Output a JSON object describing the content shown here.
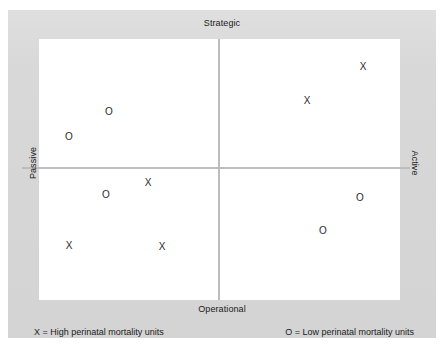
{
  "figure": {
    "type": "quadrant-matrix",
    "panel_color": "#d8d8d8",
    "plot_color": "#ffffff",
    "axis_color": "#bdbdbd"
  },
  "axes": {
    "top_label": "Strategic",
    "bottom_label": "Operational",
    "left_label": "Passive",
    "right_label": "Active"
  },
  "legend": {
    "high_label": "X = High perinatal mortality units",
    "low_label": "O = Low perinatal mortality units",
    "high_symbol": "X",
    "low_symbol": "O"
  },
  "chart_data": {
    "type": "scatter",
    "title": "",
    "subtitle": "",
    "xlabel": "Passive → Active",
    "ylabel": "Operational → Strategic",
    "xlim": [
      0,
      100
    ],
    "ylim": [
      0,
      100
    ],
    "grid": false,
    "legend_position": "bottom",
    "annotations": [
      "Strategic",
      "Operational",
      "Passive",
      "Active"
    ],
    "quadrants": [
      {
        "name": "passive-strategic",
        "x_range": [
          0,
          50
        ],
        "y_range": [
          50,
          100
        ]
      },
      {
        "name": "active-strategic",
        "x_range": [
          50,
          100
        ],
        "y_range": [
          50,
          100
        ]
      },
      {
        "name": "passive-operational",
        "x_range": [
          0,
          50
        ],
        "y_range": [
          0,
          50
        ]
      },
      {
        "name": "active-operational",
        "x_range": [
          50,
          100
        ],
        "y_range": [
          0,
          50
        ]
      }
    ],
    "axis_cross": {
      "x": 50,
      "y": 50
    },
    "series": [
      {
        "name": "High perinatal mortality units",
        "marker": "X",
        "values": [
          {
            "x": 89.8,
            "y": 89.7,
            "px": 363,
            "py": 67,
            "quadrant": "active-strategic"
          },
          {
            "x": 74.2,
            "y": 76.6,
            "px": 307,
            "py": 101,
            "quadrant": "active-strategic"
          },
          {
            "x": 30.2,
            "y": 44.8,
            "px": 148,
            "py": 183,
            "quadrant": "passive-operational"
          },
          {
            "x": 8.3,
            "y": 20.7,
            "px": 69,
            "py": 246,
            "quadrant": "passive-operational"
          },
          {
            "x": 34.1,
            "y": 20.3,
            "px": 162,
            "py": 247,
            "quadrant": "passive-operational"
          }
        ]
      },
      {
        "name": "Low perinatal mortality units",
        "marker": "O",
        "values": [
          {
            "x": 19.4,
            "y": 72.0,
            "px": 109,
            "py": 112,
            "quadrant": "passive-strategic"
          },
          {
            "x": 8.3,
            "y": 62.5,
            "px": 69,
            "py": 137,
            "quadrant": "passive-strategic"
          },
          {
            "x": 18.6,
            "y": 40.2,
            "px": 106,
            "py": 195,
            "quadrant": "passive-operational"
          },
          {
            "x": 88.9,
            "y": 39.1,
            "px": 360,
            "py": 198,
            "quadrant": "active-operational"
          },
          {
            "x": 78.7,
            "y": 26.4,
            "px": 323,
            "py": 231,
            "quadrant": "active-operational"
          }
        ]
      }
    ]
  }
}
